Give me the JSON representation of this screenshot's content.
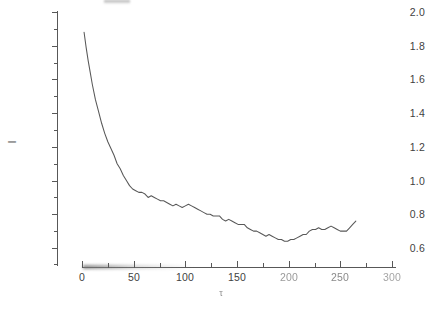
{
  "figure": {
    "background_color": "#ffffff",
    "line_color": "#585858",
    "axis_color": "#585858",
    "title": "",
    "top_artifact": "scan-artifact"
  },
  "axes": {
    "ylabel": "I",
    "xlabel": "τ",
    "ytick_labels": [
      "2.0",
      "1.8",
      "1.6",
      "1.4",
      "1.2",
      "1.0",
      "0.8",
      "0.6"
    ],
    "xtick_labels": [
      "0",
      "50",
      "100",
      "150",
      "200",
      "250",
      "300"
    ],
    "grid": "off",
    "legend": "none"
  },
  "chart_data": {
    "type": "line",
    "title": "",
    "xlabel": "τ",
    "ylabel": "I",
    "xlim": [
      0,
      300
    ],
    "ylim": [
      0.52,
      2.0
    ],
    "xticks": [
      0,
      50,
      100,
      150,
      200,
      250,
      300
    ],
    "yticks": [
      0.6,
      0.8,
      1.0,
      1.2,
      1.4,
      1.6,
      1.8,
      2.0
    ],
    "minor_ticks": true,
    "grid": false,
    "legend_position": "none",
    "series": [
      {
        "name": "I(τ)",
        "color": "#585858",
        "x": [
          2,
          4,
          6,
          8,
          10,
          13,
          16,
          19,
          22,
          25,
          28,
          31,
          34,
          37,
          40,
          43,
          46,
          49,
          52,
          55,
          58,
          61,
          64,
          67,
          70,
          73,
          76,
          79,
          82,
          85,
          88,
          91,
          94,
          97,
          100,
          103,
          106,
          109,
          112,
          115,
          118,
          121,
          124,
          127,
          130,
          133,
          136,
          139,
          142,
          145,
          148,
          151,
          154,
          157,
          160,
          163,
          166,
          169,
          172,
          175,
          178,
          181,
          184,
          187,
          190,
          193,
          196,
          199,
          202,
          205,
          208,
          211,
          214,
          217,
          220,
          223,
          226,
          229,
          232,
          235,
          238,
          241,
          244,
          247,
          250,
          253,
          256
        ],
        "y": [
          1.88,
          1.79,
          1.71,
          1.64,
          1.57,
          1.48,
          1.41,
          1.34,
          1.28,
          1.23,
          1.19,
          1.15,
          1.1,
          1.07,
          1.03,
          1.0,
          0.97,
          0.95,
          0.94,
          0.93,
          0.93,
          0.92,
          0.9,
          0.91,
          0.9,
          0.89,
          0.88,
          0.88,
          0.87,
          0.86,
          0.85,
          0.86,
          0.85,
          0.84,
          0.85,
          0.86,
          0.85,
          0.84,
          0.83,
          0.82,
          0.81,
          0.8,
          0.8,
          0.79,
          0.79,
          0.79,
          0.77,
          0.76,
          0.77,
          0.76,
          0.75,
          0.74,
          0.74,
          0.74,
          0.72,
          0.71,
          0.7,
          0.7,
          0.69,
          0.68,
          0.67,
          0.68,
          0.67,
          0.66,
          0.65,
          0.65,
          0.64,
          0.64,
          0.65,
          0.65,
          0.66,
          0.67,
          0.68,
          0.68,
          0.7,
          0.71,
          0.71,
          0.72,
          0.71,
          0.71,
          0.72,
          0.73,
          0.72,
          0.71,
          0.7,
          0.7,
          0.7
        ],
        "tail_x": [
          256,
          259,
          262,
          265
        ],
        "tail_y": [
          0.7,
          0.72,
          0.74,
          0.76
        ],
        "minimum": {
          "x": 175,
          "y": 0.64
        },
        "start": {
          "x": 2,
          "y": 1.88
        },
        "end": {
          "x": 265,
          "y": 0.76
        }
      }
    ]
  }
}
